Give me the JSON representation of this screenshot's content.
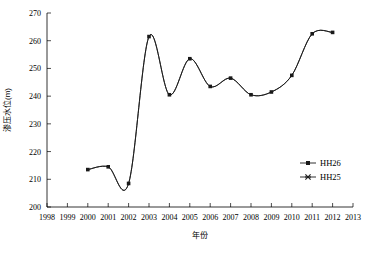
{
  "chart_data": {
    "type": "line",
    "title": "",
    "xlabel": "年份",
    "ylabel": "渗压水位(m)",
    "xlim": [
      1998,
      2013
    ],
    "ylim": [
      200,
      270
    ],
    "xticks": [
      1998,
      1999,
      2000,
      2001,
      2002,
      2003,
      2004,
      2005,
      2006,
      2007,
      2008,
      2009,
      2010,
      2011,
      2012,
      2013
    ],
    "yticks": [
      200,
      210,
      220,
      230,
      240,
      250,
      260,
      270
    ],
    "grid": false,
    "legend_position": "right-middle",
    "x": [
      2000,
      2001,
      2002,
      2003,
      2004,
      2005,
      2006,
      2007,
      2008,
      2009,
      2010,
      2011,
      2012
    ],
    "series": [
      {
        "name": "HH26",
        "marker": "square",
        "color": "#1a1a1a",
        "values": [
          213.5,
          214.5,
          208.5,
          261.5,
          240.5,
          253.5,
          243.5,
          246.5,
          240.5,
          241.5,
          247.5,
          262.5,
          263.0
        ]
      },
      {
        "name": "HH25",
        "marker": "x",
        "color": "#1a1a1a",
        "values": [
          213.5,
          214.5,
          208.5,
          261.5,
          240.5,
          253.5,
          243.5,
          246.5,
          240.5,
          241.5,
          247.5,
          262.5,
          263.0
        ]
      }
    ]
  },
  "legend": {
    "entries": [
      {
        "label": "HH26",
        "marker": "square"
      },
      {
        "label": "HH25",
        "marker": "x"
      }
    ]
  },
  "axes": {
    "y_label": "渗压水位(m)",
    "x_label": "年份"
  }
}
